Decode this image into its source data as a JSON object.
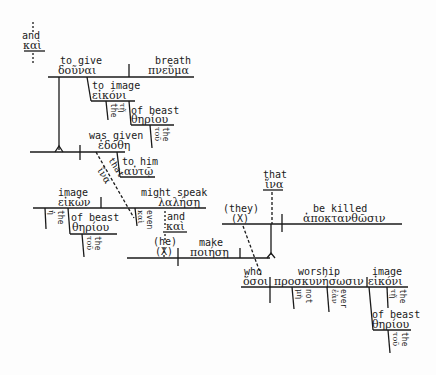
{
  "diagram": {
    "type": "sentence-diagram",
    "language": "Greek",
    "nodes": {
      "and": {
        "en": "and",
        "gr": "καὶ"
      },
      "to_give": {
        "en": "to give",
        "gr": "δοῦναι"
      },
      "breath": {
        "en": "breath",
        "gr": "πνεῦμα"
      },
      "to_image": {
        "en": "to image",
        "gr": "εἰκόνι"
      },
      "the1": {
        "en": "the",
        "gr": "τῇ"
      },
      "of_beast1": {
        "en": "of beast",
        "gr": "θηρίου"
      },
      "the2": {
        "en": "the",
        "gr": "τοῦ"
      },
      "was_given": {
        "en": "was given",
        "gr": "ἐδόθη"
      },
      "to_him": {
        "en": "to him",
        "gr": "αὐτῷ"
      },
      "that1": {
        "en": "that",
        "gr": "ἵνα"
      },
      "image_subj": {
        "en": "image",
        "gr": "εἰκὼν"
      },
      "the3": {
        "en": "the",
        "gr": "ἡ"
      },
      "of_beast2": {
        "en": "of beast",
        "gr": "θηρίου"
      },
      "the4": {
        "en": "the",
        "gr": "τοῦ"
      },
      "even": {
        "en": "even",
        "gr": "καὶ"
      },
      "might_speak": {
        "en": "might speak",
        "gr": "λαλήσῃ"
      },
      "and2": {
        "en": "and",
        "gr": "καὶ"
      },
      "he": {
        "en": "(he)",
        "gr": "(X)"
      },
      "make": {
        "en": "make",
        "gr": "ποιήσῃ"
      },
      "they": {
        "en": "(they)",
        "gr": "(X)"
      },
      "that2": {
        "en": "that",
        "gr": "ἵνα"
      },
      "be_killed": {
        "en": "be killed",
        "gr": "ἀποκτανθῶσιν"
      },
      "who": {
        "en": "who",
        "gr": "ὅσοι"
      },
      "worship": {
        "en": "worship",
        "gr": "προσκυνήσωσιν"
      },
      "image_obj": {
        "en": "image",
        "gr": "εἰκόνι"
      },
      "not": {
        "en": "not",
        "gr": "μὴ"
      },
      "ever": {
        "en": "ever",
        "gr": "ἐὰν"
      },
      "the5": {
        "en": "the",
        "gr": "τῇ"
      },
      "of_beast3": {
        "en": "of beast",
        "gr": "θηρίου"
      },
      "the6": {
        "en": "the",
        "gr": "τοῦ"
      }
    }
  }
}
